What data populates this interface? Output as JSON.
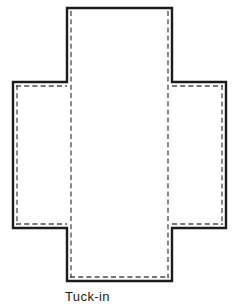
{
  "diagram": {
    "background_color": "#ffffff",
    "stroke_color": "#1b1b1b",
    "fold_line_color": "#4a4a4a",
    "panel_fill": "#ffffff",
    "labels": [
      {
        "id": "tuck-in",
        "text": "Tuck-in",
        "x": 65,
        "y": 289
      }
    ],
    "panels": [
      {
        "id": "center-panel",
        "name": "center-panel",
        "x": 67,
        "y": 8,
        "width": 105,
        "height": 273,
        "cut_edges": [
          "top",
          "left",
          "right",
          "bottom"
        ],
        "fold_edges": [
          "left",
          "right",
          "bottom"
        ]
      },
      {
        "id": "left-flap",
        "name": "left-flap",
        "x": 13,
        "y": 82,
        "width": 54,
        "height": 146,
        "cut_edges": [
          "top",
          "left",
          "bottom"
        ],
        "fold_edges": [
          "top",
          "left",
          "bottom"
        ]
      },
      {
        "id": "right-flap",
        "name": "right-flap",
        "x": 172,
        "y": 82,
        "width": 54,
        "height": 146,
        "cut_edges": [
          "top",
          "right",
          "bottom"
        ],
        "fold_edges": [
          "top",
          "right",
          "bottom"
        ]
      }
    ],
    "outline_path": "M 67 8 L 172 8 L 172 82 L 226 82 L 226 228 L 172 228 L 172 281 L 67 281 L 67 228 L 13 228 L 13 82 L 67 82 Z",
    "dashed_segments": [
      {
        "id": "center-left-fold",
        "x1": 71,
        "y1": 12,
        "x2": 71,
        "y2": 277
      },
      {
        "id": "center-right-fold",
        "x1": 168,
        "y1": 12,
        "x2": 168,
        "y2": 277
      },
      {
        "id": "center-bottom-fold",
        "x1": 71,
        "y1": 277,
        "x2": 168,
        "y2": 277
      },
      {
        "id": "left-flap-top-fold",
        "x1": 17,
        "y1": 86,
        "x2": 67,
        "y2": 86
      },
      {
        "id": "left-flap-left-fold",
        "x1": 17,
        "y1": 86,
        "x2": 17,
        "y2": 224
      },
      {
        "id": "left-flap-bottom-fold",
        "x1": 17,
        "y1": 224,
        "x2": 67,
        "y2": 224
      },
      {
        "id": "right-flap-top-fold",
        "x1": 172,
        "y1": 86,
        "x2": 222,
        "y2": 86
      },
      {
        "id": "right-flap-right-fold",
        "x1": 222,
        "y1": 86,
        "x2": 222,
        "y2": 224
      },
      {
        "id": "right-flap-bottom-fold",
        "x1": 172,
        "y1": 224,
        "x2": 222,
        "y2": 224
      }
    ]
  }
}
